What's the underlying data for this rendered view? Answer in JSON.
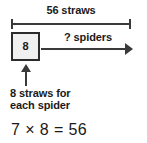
{
  "diagram": {
    "type": "bar-model",
    "total": {
      "label": "56 straws",
      "value": 56,
      "unit": "straws"
    },
    "unit_box": {
      "value": "8"
    },
    "arrow": {
      "label": "? spiders",
      "unknown": "?",
      "unit": "spiders"
    },
    "callout": {
      "line1": "8 straws for",
      "line2": "each spider"
    },
    "equation": {
      "text": "7 × 8 = 56",
      "factor1": 7,
      "operator": "×",
      "factor2": 8,
      "equals": "=",
      "product": 56
    },
    "colors": {
      "ink": "#1a1a1a",
      "line": "#3a3a3a",
      "box_fill": "#f0f0f0",
      "box_border": "#2b2b2b",
      "background": "#ffffff"
    }
  }
}
